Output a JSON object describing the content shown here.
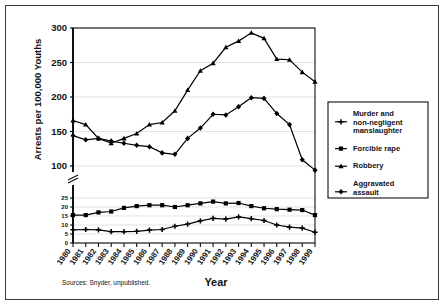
{
  "figure": {
    "background": "#ffffff",
    "frame_color": "#3a3a3a",
    "line_color": "#000000",
    "grid_color": "#d9d9d9",
    "source_note": "Sources: Snyder, unpublished.",
    "xlabel": "Year",
    "ylabel": "Arrests per 100,000 Youths"
  },
  "legend": {
    "items": [
      {
        "label_line1": "Murder and",
        "label_line2": "non-negligent",
        "label_line3": "manslaughter",
        "marker": "plus"
      },
      {
        "label_line1": "Forcible rape",
        "label_line2": "",
        "label_line3": "",
        "marker": "square"
      },
      {
        "label_line1": "Robbery",
        "label_line2": "",
        "label_line3": "",
        "marker": "triangle"
      },
      {
        "label_line1": "Aggravated",
        "label_line2": "assault",
        "label_line3": "",
        "marker": "diamond"
      }
    ]
  },
  "chart_data": {
    "type": "line",
    "title": "",
    "xlabel": "Year",
    "ylabel": "Arrests per 100,000 Youths",
    "grid": true,
    "legend_position": "right",
    "broken_axis": true,
    "categories": [
      "1980",
      "1981",
      "1982",
      "1983",
      "1984",
      "1985",
      "1986",
      "1987",
      "1988",
      "1989",
      "1990",
      "1991",
      "1992",
      "1993",
      "1994",
      "1995",
      "1996",
      "1997",
      "1998",
      "1999"
    ],
    "upper_panel": {
      "ylim": [
        100,
        300
      ],
      "yticks": [
        100,
        150,
        200,
        250,
        300
      ],
      "series": [
        {
          "name": "Robbery",
          "values": [
            166,
            160,
            140,
            133,
            140,
            147,
            160,
            163,
            180,
            210,
            238,
            249,
            272,
            281,
            293,
            285,
            255,
            254,
            236,
            222
          ]
        },
        {
          "name": "Aggravated assault",
          "values": [
            144,
            138,
            140,
            136,
            133,
            130,
            128,
            119,
            117,
            140,
            155,
            175,
            174,
            186,
            199,
            198,
            176,
            160,
            109,
            94
          ]
        }
      ]
    },
    "lower_panel": {
      "ylim": [
        0,
        25
      ],
      "yticks": [
        0,
        5,
        10,
        15,
        20,
        25
      ],
      "series": [
        {
          "name": "Forcible rape",
          "values": [
            15.5,
            15.5,
            17.0,
            17.5,
            19.5,
            20.5,
            21.0,
            21.0,
            20.0,
            21.0,
            22.0,
            23.0,
            22.0,
            22.2,
            20.5,
            19.3,
            18.8,
            18.5,
            18.3,
            15.5
          ]
        },
        {
          "name": "Murder and non-negligent manslaughter",
          "values": [
            7.3,
            7.5,
            7.3,
            6.3,
            6.3,
            6.5,
            7.2,
            7.5,
            9.3,
            10.5,
            12.3,
            13.7,
            13.3,
            14.5,
            13.5,
            12.5,
            10.0,
            8.8,
            8.3,
            6.0
          ]
        }
      ]
    }
  }
}
